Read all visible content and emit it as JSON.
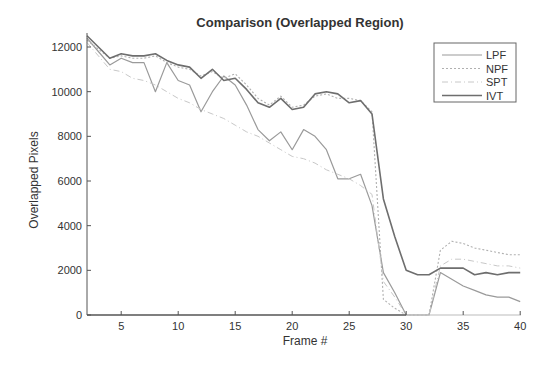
{
  "chart_data": {
    "type": "line",
    "title": "Comparison (Overlapped Region)",
    "xlabel": "Frame #",
    "ylabel": "Overlapped Pixels",
    "xlim": [
      2,
      40
    ],
    "ylim": [
      0,
      12600
    ],
    "xticks": [
      5,
      10,
      15,
      20,
      25,
      30,
      35,
      40
    ],
    "yticks": [
      0,
      2000,
      4000,
      6000,
      8000,
      10000,
      12000
    ],
    "grid": false,
    "legend_position": "upper right",
    "x": [
      2,
      3,
      4,
      5,
      6,
      7,
      8,
      9,
      10,
      11,
      12,
      13,
      14,
      15,
      16,
      17,
      18,
      19,
      20,
      21,
      22,
      23,
      24,
      25,
      26,
      27,
      28,
      29,
      30,
      31,
      32,
      33,
      34,
      35,
      36,
      37,
      38,
      39,
      40
    ],
    "series": [
      {
        "name": "LPF",
        "color": "#9a9a9a",
        "dash": "",
        "width": 1.2,
        "values": [
          12400,
          11800,
          11200,
          11500,
          11300,
          11300,
          10000,
          11300,
          10500,
          10300,
          9100,
          10000,
          10700,
          10300,
          9400,
          8300,
          7800,
          8200,
          7400,
          8300,
          8000,
          7400,
          6100,
          6100,
          6300,
          4900,
          1900,
          1000,
          0,
          0,
          0,
          1900,
          1600,
          1300,
          1100,
          900,
          800,
          800,
          600
        ]
      },
      {
        "name": "NPF",
        "color": "#b0b0b0",
        "dash": "2,2",
        "width": 1.1,
        "values": [
          12300,
          11900,
          11500,
          11600,
          11500,
          11500,
          11600,
          11300,
          11100,
          11000,
          10700,
          10900,
          10600,
          10800,
          10300,
          9700,
          9400,
          9800,
          9300,
          9400,
          9800,
          9900,
          9700,
          9700,
          9600,
          9100,
          700,
          300,
          0,
          0,
          0,
          2900,
          3300,
          3200,
          3000,
          2900,
          2800,
          2700,
          2700
        ]
      },
      {
        "name": "SPT",
        "color": "#c8c8c8",
        "dash": "6,3,1,3",
        "width": 1.0,
        "values": [
          12200,
          11600,
          11000,
          10900,
          10600,
          10500,
          10300,
          10000,
          9700,
          9500,
          9200,
          9000,
          8800,
          8500,
          8200,
          8000,
          7700,
          7400,
          7100,
          7000,
          6800,
          6500,
          6300,
          6100,
          5800,
          5400,
          1500,
          800,
          0,
          0,
          0,
          2200,
          2500,
          2500,
          2400,
          2300,
          2200,
          2200,
          2100
        ]
      },
      {
        "name": "IVT",
        "color": "#6e6e6e",
        "dash": "",
        "width": 1.6,
        "values": [
          12500,
          12000,
          11500,
          11700,
          11600,
          11600,
          11700,
          11400,
          11200,
          11100,
          10600,
          11000,
          10500,
          10600,
          10100,
          9500,
          9300,
          9700,
          9200,
          9300,
          9900,
          10000,
          9900,
          9500,
          9600,
          9000,
          5200,
          3500,
          2000,
          1800,
          1800,
          2100,
          2100,
          2100,
          1800,
          1900,
          1800,
          1900,
          1900
        ]
      }
    ]
  }
}
